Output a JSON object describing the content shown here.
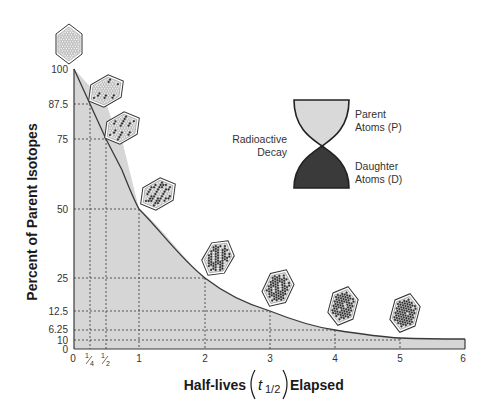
{
  "chart_data": {
    "type": "area",
    "title": "",
    "xlabel": "Half-lives (t1/2) Elapsed",
    "xlabel_parts": {
      "before": "Half-lives",
      "symbol": "t",
      "subscript": "1/2",
      "after": "Elapsed"
    },
    "ylabel": "Percent of Parent Isotopes",
    "x_ticks": [
      "0",
      "1/4",
      "1/2",
      "1",
      "2",
      "3",
      "4",
      "5",
      "6"
    ],
    "y_ticks": [
      "0",
      "10",
      "6.25",
      "12.5",
      "25",
      "50",
      "75",
      "87.5",
      "100"
    ],
    "xlim": [
      0,
      6
    ],
    "ylim": [
      0,
      100
    ],
    "grid": "dotted reference lines at marked points",
    "series": [
      {
        "name": "Parent isotopes remaining",
        "x": [
          0,
          0.25,
          0.5,
          1,
          2,
          3,
          4,
          5,
          6
        ],
        "y": [
          100,
          87.5,
          75,
          50,
          25,
          12.5,
          6.25,
          3.125,
          1.5625
        ]
      }
    ],
    "annotations": [
      {
        "type": "hexagon-atoms",
        "x": 0,
        "parent_fraction": 1.0
      },
      {
        "type": "hexagon-atoms",
        "x": 0.25,
        "parent_fraction": 0.875
      },
      {
        "type": "hexagon-atoms",
        "x": 0.5,
        "parent_fraction": 0.75
      },
      {
        "type": "hexagon-atoms",
        "x": 1,
        "parent_fraction": 0.5
      },
      {
        "type": "hexagon-atoms",
        "x": 2,
        "parent_fraction": 0.25
      },
      {
        "type": "hexagon-atoms",
        "x": 3,
        "parent_fraction": 0.125
      },
      {
        "type": "hexagon-atoms",
        "x": 4,
        "parent_fraction": 0.0625
      },
      {
        "type": "hexagon-atoms",
        "x": 5,
        "parent_fraction": 0.03125
      }
    ],
    "legend": {
      "title": "Radioactive Decay",
      "items": [
        {
          "label_line1": "Parent",
          "label_line2": "Atoms (P)",
          "color": "#d9d9d9"
        },
        {
          "label_line1": "Daughter",
          "label_line2": "Atoms (D)",
          "color": "#3a3a3a"
        }
      ]
    }
  },
  "labels": {
    "y_axis": "Percent of Parent Isotopes",
    "x_axis_before": "Half-lives",
    "x_axis_symbol": "t",
    "x_axis_sub": "1/2",
    "x_axis_after": "Elapsed",
    "legend_title_1": "Radioactive",
    "legend_title_2": "Decay",
    "parent_1": "Parent",
    "parent_2": "Atoms (P)",
    "daughter_1": "Daughter",
    "daughter_2": "Atoms (D)"
  },
  "ticks": {
    "y": {
      "t100": "100",
      "t875": "87.5",
      "t75": "75",
      "t50": "50",
      "t25": "25",
      "t125": "12.5",
      "t625": "6.25",
      "t10": "10",
      "t0": "0"
    },
    "x": {
      "t0": "0",
      "t1": "1",
      "t2": "2",
      "t3": "3",
      "t4": "4",
      "t5": "5",
      "t6": "6",
      "quarter_num": "1",
      "quarter_den": "4",
      "half_num": "1",
      "half_den": "2"
    }
  },
  "colors": {
    "fill": "#d6d6d6",
    "curve": "#3a3a3a",
    "parent_bulb": "#d9d9d9",
    "daughter_bulb": "#3a3a3a",
    "atom_parent": "#ffffff",
    "atom_daughter": "#2a2a2a"
  }
}
